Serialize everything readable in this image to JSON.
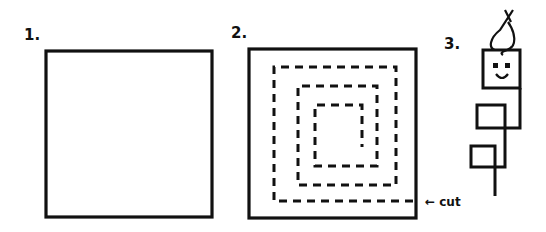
{
  "diagram": {
    "steps": [
      {
        "label": "1.",
        "description": "plain square"
      },
      {
        "label": "2.",
        "description": "square with dashed spiral cut lines"
      },
      {
        "label": "3.",
        "description": "cut spiral pulled into hanging figure with face"
      }
    ],
    "annotation": {
      "arrow": "←",
      "text": "cut"
    },
    "colors": {
      "ink": "#111111",
      "background": "#ffffff"
    }
  }
}
